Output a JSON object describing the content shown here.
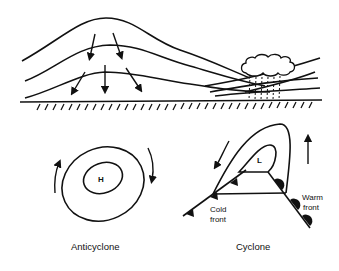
{
  "diagram": {
    "top_panel": {
      "description": "Cross-section: high pressure dome with descending air on left, frontal lifting with cloud and rain on right",
      "elements": [
        "subsiding-air-arrows",
        "isobar-curves",
        "cloud",
        "rain-streaks",
        "ground-hatching"
      ]
    },
    "anticyclone": {
      "center_label": "H",
      "caption": "Anticyclone",
      "rotation": "clockwise"
    },
    "cyclone": {
      "center_label": "L",
      "caption": "Cyclone",
      "cold_front_label_line1": "Cold",
      "cold_front_label_line2": "front",
      "warm_front_label_line1": "Warm",
      "warm_front_label_line2": "front",
      "rotation": "counterclockwise"
    },
    "colors": {
      "ink": "#111111",
      "background": "#ffffff"
    }
  }
}
